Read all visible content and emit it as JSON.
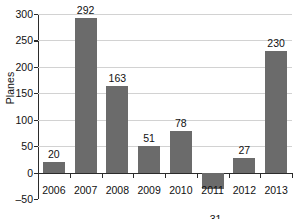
{
  "chart_data": {
    "type": "bar",
    "title": "",
    "subtitle": "",
    "xlabel": "",
    "ylabel": "Planes",
    "categories": [
      "2006",
      "2007",
      "2008",
      "2009",
      "2010",
      "2011",
      "2012",
      "2013"
    ],
    "values": [
      20,
      292,
      163,
      51,
      78,
      -31,
      27,
      230
    ],
    "value_labels": [
      "20",
      "292",
      "163",
      "51",
      "78",
      "–31",
      "27",
      "230"
    ],
    "ylim": [
      -50,
      300
    ],
    "ytick_values": [
      -50,
      0,
      50,
      100,
      150,
      200,
      250,
      300
    ],
    "ytick_labels": [
      "–50",
      "0",
      "50",
      "100",
      "150",
      "200",
      "250",
      "300"
    ],
    "grid": "horizontal",
    "legend": "none",
    "bar_color": "#6b6b6b",
    "grid_color": "#d2d2d2",
    "axis_color": "#2b2b2b"
  }
}
